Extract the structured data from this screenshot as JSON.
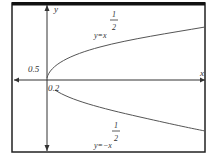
{
  "figure": {
    "axes": {
      "x_label": "x",
      "y_label": "y"
    },
    "curves": [
      {
        "name": "upper",
        "label_base": "y=x",
        "exponent_num": "1",
        "exponent_den": "2"
      },
      {
        "name": "lower",
        "label_base": "y=−x",
        "exponent_num": "1",
        "exponent_den": "2"
      }
    ],
    "annotations": {
      "y_tick": "0.5",
      "x_tick": "0.2"
    }
  }
}
